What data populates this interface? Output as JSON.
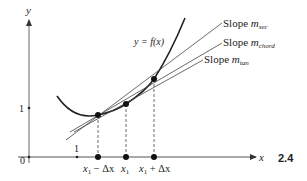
{
  "diagram": {
    "figure_number": "2.4",
    "axes": {
      "x_label": "x",
      "y_label": "y",
      "origin_label": "0",
      "x_tick_label": "1",
      "y_tick_label": "1"
    },
    "curve": {
      "label": "y = f(x)"
    },
    "lines": [
      {
        "id": "sec",
        "label_prefix": "Slope ",
        "label_m": "m",
        "label_sub": "sec"
      },
      {
        "id": "chord",
        "label_prefix": "Slope ",
        "label_m": "m",
        "label_sub": "chord"
      },
      {
        "id": "tan",
        "label_prefix": "Slope ",
        "label_m": "m",
        "label_sub": "tan"
      }
    ],
    "points": [
      {
        "label_main": "x",
        "label_sub": "1",
        "label_suffix": " − Δx"
      },
      {
        "label_main": "x",
        "label_sub": "1",
        "label_suffix": ""
      },
      {
        "label_main": "x",
        "label_sub": "1",
        "label_suffix": " + Δx"
      }
    ],
    "colors": {
      "ink": "#222222",
      "axis": "#555555"
    }
  }
}
